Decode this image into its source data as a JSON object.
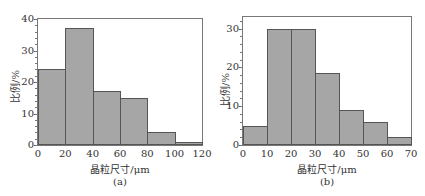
{
  "chart_data": [
    {
      "type": "bar",
      "panel_label": "(a)",
      "xlabel": "晶粒尺寸/μm",
      "ylabel": "比例/%",
      "bin_edges": [
        0,
        20,
        40,
        60,
        80,
        100,
        120
      ],
      "categories": [
        "0-20",
        "20-40",
        "40-60",
        "60-80",
        "80-100",
        "100-120"
      ],
      "values": [
        24,
        37,
        17,
        15,
        4,
        1
      ],
      "xlim": [
        0,
        120
      ],
      "ylim": [
        0,
        40
      ],
      "xticks": [
        "0",
        "20",
        "40",
        "60",
        "80",
        "100",
        "120"
      ],
      "yticks": [
        "0",
        "10",
        "20",
        "30",
        "40"
      ],
      "bar_color": "#a6a6a6",
      "grid": false
    },
    {
      "type": "bar",
      "panel_label": "(b)",
      "xlabel": "晶粒尺寸/μm",
      "ylabel": "比例/%",
      "bin_edges": [
        0,
        10,
        20,
        30,
        40,
        50,
        60,
        70
      ],
      "categories": [
        "0-10",
        "10-20",
        "20-30",
        "30-40",
        "40-50",
        "50-60",
        "60-70"
      ],
      "values": [
        5,
        30,
        30,
        18.5,
        9,
        6,
        2
      ],
      "xlim": [
        0,
        70
      ],
      "ylim": [
        0,
        33
      ],
      "xticks": [
        "0",
        "10",
        "20",
        "30",
        "40",
        "50",
        "60",
        "70"
      ],
      "yticks": [
        "0",
        "10",
        "20",
        "30"
      ],
      "bar_color": "#a6a6a6",
      "grid": false
    }
  ],
  "panels": {
    "a": {
      "caption": "(a)",
      "xlabel": "晶粒尺寸/μm",
      "ylabel": "比例/%",
      "yticks": [
        "0",
        "10",
        "20",
        "30",
        "40"
      ],
      "xticks": [
        "0",
        "20",
        "40",
        "60",
        "80",
        "100",
        "120"
      ]
    },
    "b": {
      "caption": "(b)",
      "xlabel": "晶粒尺寸/μm",
      "ylabel": "比例/%",
      "yticks": [
        "0",
        "10",
        "20",
        "30"
      ],
      "xticks": [
        "0",
        "10",
        "20",
        "30",
        "40",
        "50",
        "60",
        "70"
      ]
    }
  }
}
